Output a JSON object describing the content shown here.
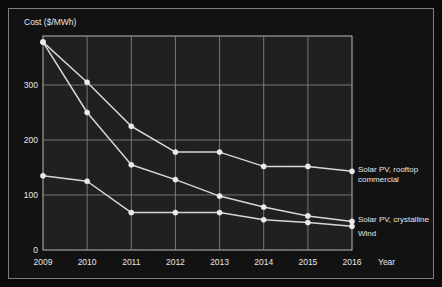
{
  "chart_data": {
    "type": "line",
    "title": "",
    "xlabel": "Year",
    "ylabel": "Cost ($/MWh)",
    "x": [
      2009,
      2010,
      2011,
      2012,
      2013,
      2014,
      2015,
      2016
    ],
    "xtick_labels": [
      "2009",
      "2010",
      "2011",
      "2012",
      "2013",
      "2014",
      "2015",
      "2016"
    ],
    "ytick_labels": [
      "0",
      "100",
      "200",
      "300"
    ],
    "yticks": [
      0,
      100,
      200,
      300
    ],
    "ylim": [
      0,
      380
    ],
    "xlim": [
      2009,
      2016
    ],
    "grid": true,
    "legend_position": "right-inline-labels",
    "series": [
      {
        "name": "Solar PV, rooftop commercial",
        "label_line_1": "Solar PV, rooftop",
        "label_line_2": "commercial",
        "values": [
          378,
          305,
          225,
          178,
          178,
          152,
          152,
          143
        ],
        "color": "#d9d9d9"
      },
      {
        "name": "Solar PV, crystalline",
        "label_line_1": "Solar PV, crystalline",
        "label_line_2": "",
        "values": [
          378,
          250,
          155,
          128,
          98,
          78,
          62,
          52
        ],
        "color": "#d9d9d9"
      },
      {
        "name": "Wind",
        "label_line_1": "Wind",
        "label_line_2": "",
        "values": [
          135,
          125,
          68,
          68,
          68,
          55,
          50,
          43
        ],
        "color": "#d9d9d9"
      }
    ]
  },
  "figure": {
    "y_axis_caption": "Cost ($/MWh)",
    "x_axis_caption": "Year",
    "background_color": "#111111",
    "plot_background_color": "#1f1f1f",
    "grid_color": "#8d8d8d",
    "text_color": "#e8e8e8",
    "marker_color": "#ededed"
  },
  "annotations": {
    "rooftop_label_1": "Solar PV, rooftop",
    "rooftop_label_2": "commercial",
    "crystalline_label": "Solar PV, crystalline",
    "wind_label": "Wind"
  },
  "ticks": {
    "y": [
      "300",
      "200",
      "100",
      "0"
    ],
    "x": [
      "2009",
      "2010",
      "2011",
      "2012",
      "2013",
      "2014",
      "2015",
      "2016"
    ]
  }
}
